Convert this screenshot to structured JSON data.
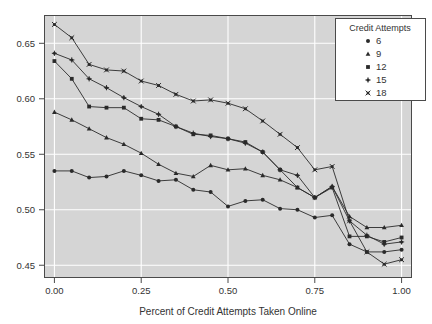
{
  "chart_data": {
    "type": "line",
    "title": "",
    "xlabel": "Percent of Credit Attempts Taken Online",
    "ylabel": "",
    "xlim": [
      -0.03,
      1.03
    ],
    "ylim": [
      0.4385,
      0.6755
    ],
    "xticks": [
      0.0,
      0.25,
      0.5,
      0.75,
      1.0
    ],
    "xticklabels": [
      "0.00",
      "0.25",
      "0.50",
      "0.75",
      "1.00"
    ],
    "yticks": [
      0.45,
      0.5,
      0.55,
      0.6,
      0.65
    ],
    "yticklabels": [
      "0.45",
      "0.50",
      "0.55",
      "0.60",
      "0.65"
    ],
    "grid": true,
    "grid_color": "#ffffff",
    "panel_background": "#d5d5d5",
    "line_color": "#2a2a2a",
    "legend": {
      "title": "Credit Attempts",
      "position": "top-right-inset",
      "entries": [
        {
          "label": "6",
          "symbol": "circle"
        },
        {
          "label": "9",
          "symbol": "triangle"
        },
        {
          "label": "12",
          "symbol": "square"
        },
        {
          "label": "15",
          "symbol": "plus"
        },
        {
          "label": "18",
          "symbol": "cross"
        }
      ]
    },
    "x": [
      0.0,
      0.05,
      0.1,
      0.15,
      0.2,
      0.25,
      0.3,
      0.35,
      0.4,
      0.45,
      0.5,
      0.55,
      0.6,
      0.65,
      0.7,
      0.75,
      0.8,
      0.85,
      0.9,
      0.95,
      1.0
    ],
    "series": [
      {
        "name": "6",
        "symbol": "circle",
        "values": [
          0.535,
          0.535,
          0.529,
          0.53,
          0.535,
          0.531,
          0.526,
          0.527,
          0.518,
          0.516,
          0.503,
          0.508,
          0.509,
          0.501,
          0.5,
          0.493,
          0.495,
          0.469,
          0.462,
          0.462,
          0.464
        ]
      },
      {
        "name": "9",
        "symbol": "triangle",
        "values": [
          0.588,
          0.581,
          0.573,
          0.565,
          0.559,
          0.551,
          0.541,
          0.533,
          0.53,
          0.54,
          0.536,
          0.537,
          0.531,
          0.527,
          0.52,
          0.511,
          0.521,
          0.494,
          0.484,
          0.484,
          0.486
        ]
      },
      {
        "name": "12",
        "symbol": "square",
        "values": [
          0.634,
          0.618,
          0.593,
          0.592,
          0.592,
          0.582,
          0.581,
          0.575,
          0.568,
          0.567,
          0.564,
          0.561,
          0.552,
          0.536,
          0.52,
          0.511,
          0.52,
          0.476,
          0.476,
          0.471,
          0.475
        ]
      },
      {
        "name": "15",
        "symbol": "plus",
        "values": [
          0.641,
          0.635,
          0.618,
          0.61,
          0.601,
          0.593,
          0.586,
          0.575,
          0.569,
          0.566,
          0.564,
          0.56,
          0.552,
          0.536,
          0.531,
          0.511,
          0.521,
          0.49,
          0.477,
          0.469,
          0.471
        ]
      },
      {
        "name": "18",
        "symbol": "cross",
        "values": [
          0.667,
          0.655,
          0.631,
          0.626,
          0.625,
          0.616,
          0.612,
          0.604,
          0.598,
          0.599,
          0.596,
          0.591,
          0.58,
          0.568,
          0.556,
          0.536,
          0.539,
          0.49,
          0.462,
          0.451,
          0.455
        ]
      }
    ]
  }
}
